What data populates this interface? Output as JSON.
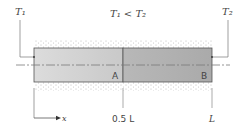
{
  "diagram": {
    "title": "T₁ < T₂",
    "left_temperature": "T₁",
    "right_temperature": "T₂",
    "section_a_label": "A",
    "section_b_label": "B",
    "x_axis_label": "x",
    "midpoint_label": "0.5 L",
    "end_label": "L",
    "colors": {
      "section_a": "#d4d4d4",
      "section_b": "#b3b3b3",
      "outline": "#555555",
      "insulation": "#bdbdbd",
      "centerline": "#888888"
    }
  }
}
